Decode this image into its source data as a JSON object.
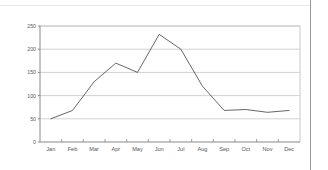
{
  "chart_data": {
    "type": "line",
    "title": "",
    "subtitle": "",
    "xlabel": "",
    "ylabel": "",
    "categories": [
      "Jan",
      "Feb",
      "Mar",
      "Apr",
      "May",
      "Jun",
      "Jul",
      "Aug",
      "Sep",
      "Oct",
      "Nov",
      "Dec"
    ],
    "values": [
      50,
      68,
      130,
      170,
      150,
      232,
      200,
      120,
      68,
      70,
      64,
      68
    ],
    "series": [
      {
        "name": "",
        "values": [
          50,
          68,
          130,
          170,
          150,
          232,
          200,
          120,
          68,
          70,
          64,
          68
        ]
      }
    ],
    "ylim": [
      0,
      250
    ],
    "ytick_labels": [
      "0",
      "50",
      "100",
      "150",
      "200",
      "250"
    ],
    "ytick_values": [
      0,
      50,
      100,
      150,
      200,
      250
    ],
    "grid": true,
    "grid_axis": "y",
    "legend": false,
    "legend_position": "none",
    "annotations": [],
    "colors": {
      "line": "#555555",
      "grid": "#d2d2d2",
      "axis": "#888888",
      "background": "#ffffff",
      "text": "#555555",
      "top_rule": "#e8e8e8",
      "page_border": "#9a9a9a"
    }
  }
}
